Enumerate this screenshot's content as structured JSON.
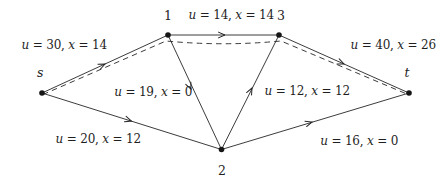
{
  "diagram": {
    "type": "flow-network",
    "background": "#ffffff",
    "ink": "#262626",
    "nodes": [
      {
        "id": "s",
        "label": "s",
        "style": "italic"
      },
      {
        "id": "1",
        "label": "1",
        "style": "upright"
      },
      {
        "id": "2",
        "label": "2",
        "style": "upright"
      },
      {
        "id": "3",
        "label": "3",
        "style": "upright"
      },
      {
        "id": "t",
        "label": "t",
        "style": "italic"
      }
    ],
    "edges": [
      {
        "from": "s",
        "to": "1",
        "u": 30,
        "x": 14,
        "label_parts": [
          "u",
          " = 30, ",
          "x",
          " = 14"
        ]
      },
      {
        "from": "s",
        "to": "2",
        "u": 20,
        "x": 12,
        "label_parts": [
          "u",
          " = 20, ",
          "x",
          " = 12"
        ]
      },
      {
        "from": "1",
        "to": "3",
        "u": 14,
        "x": 14,
        "label_parts": [
          "u",
          " = 14, ",
          "x",
          " = 14"
        ]
      },
      {
        "from": "1",
        "to": "2",
        "u": 19,
        "x": 0,
        "label_parts": [
          "u",
          " = 19, ",
          "x",
          " = 0"
        ]
      },
      {
        "from": "2",
        "to": "3",
        "u": 12,
        "x": 12,
        "label_parts": [
          "u",
          " = 12, ",
          "x",
          " = 12"
        ]
      },
      {
        "from": "3",
        "to": "t",
        "u": 40,
        "x": 26,
        "label_parts": [
          "u",
          " = 40, ",
          "x",
          " = 26"
        ]
      },
      {
        "from": "2",
        "to": "t",
        "u": 16,
        "x": 0,
        "label_parts": [
          "u",
          " = 16, ",
          "x",
          " = 0"
        ]
      }
    ],
    "dashed_path": [
      "s",
      "1",
      "3",
      "t"
    ]
  }
}
